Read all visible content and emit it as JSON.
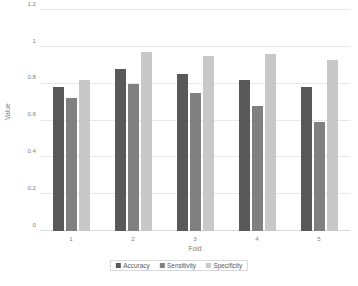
{
  "chart_data": {
    "type": "bar",
    "title": "",
    "subtitle": "",
    "xlabel": "Fold",
    "ylabel": "Value",
    "categories": [
      "1",
      "2",
      "3",
      "4",
      "5"
    ],
    "series": [
      {
        "name": "Accuracy",
        "color": "#595959",
        "values": [
          0.78,
          0.88,
          0.85,
          0.82,
          0.78
        ]
      },
      {
        "name": "Sensitivity",
        "color": "#808080",
        "values": [
          0.72,
          0.8,
          0.75,
          0.68,
          0.59
        ]
      },
      {
        "name": "Specificity",
        "color": "#c8c8c8",
        "values": [
          0.82,
          0.97,
          0.95,
          0.96,
          0.93
        ]
      }
    ],
    "ylim": [
      0,
      1.2
    ],
    "ytick_values": [
      0,
      0.2,
      0.4,
      0.6,
      0.8,
      1,
      1.2
    ],
    "ytick_labels": [
      "0",
      "0.2",
      "0.4",
      "0.6",
      "0.8",
      "1",
      "1.2"
    ],
    "grid": "horizontal",
    "legend_position": "bottom",
    "background_color": "#ffffff",
    "grid_color": "#e8e8e8",
    "text_color": "#7f7f7f"
  }
}
